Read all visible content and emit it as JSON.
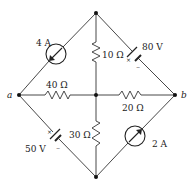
{
  "diagram": {
    "type": "circuit",
    "nodes": {
      "top": {
        "label": ""
      },
      "a": {
        "label": "a"
      },
      "b": {
        "label": "b"
      },
      "center": {
        "label": ""
      },
      "bottom": {
        "label": ""
      }
    },
    "components": [
      {
        "id": "cs1",
        "kind": "current-source",
        "label": "4 A",
        "between": [
          "a",
          "top"
        ],
        "direction": "toward a"
      },
      {
        "id": "v1",
        "kind": "voltage-source",
        "label": "80 V",
        "between": [
          "top",
          "b"
        ],
        "plus_marker": "×",
        "minus_marker": "−"
      },
      {
        "id": "r10",
        "kind": "resistor",
        "label": "10 Ω",
        "between": [
          "top",
          "center"
        ]
      },
      {
        "id": "r40",
        "kind": "resistor",
        "label": "40 Ω",
        "between": [
          "a",
          "center"
        ]
      },
      {
        "id": "r20",
        "kind": "resistor",
        "label": "20 Ω",
        "between": [
          "center",
          "b"
        ]
      },
      {
        "id": "v2",
        "kind": "voltage-source",
        "label": "50 V",
        "between": [
          "a",
          "bottom"
        ],
        "plus_marker": "×",
        "minus_marker": "−"
      },
      {
        "id": "r30",
        "kind": "resistor",
        "label": "30 Ω",
        "between": [
          "center",
          "bottom"
        ]
      },
      {
        "id": "cs2",
        "kind": "current-source",
        "label": "2 A",
        "between": [
          "bottom",
          "b"
        ],
        "direction": "toward b"
      }
    ]
  }
}
